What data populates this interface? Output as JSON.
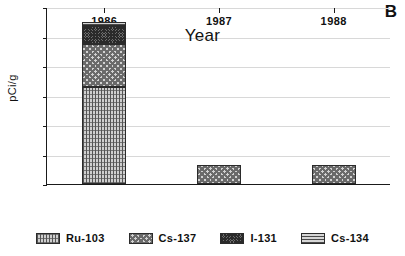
{
  "chart_data": {
    "type": "bar",
    "subtype": "stacked-bar",
    "title": "",
    "panel_label": "B",
    "xlabel": "Year",
    "ylabel": "pCi/g",
    "categories": [
      "1986",
      "1987",
      "1988"
    ],
    "ylim": [
      0,
      1.2
    ],
    "ytick_labels": [
      "0",
      "0.2",
      "0.4",
      "0.6",
      "0.8",
      "1",
      "1.2"
    ],
    "ytick_values": [
      0,
      0.2,
      0.4,
      0.6,
      0.8,
      1.0,
      1.2
    ],
    "grid": "horizontal",
    "legend_position": "bottom",
    "series": [
      {
        "name": "Ru-103",
        "pattern": "vertical-grid",
        "values": [
          0.66,
          0,
          0
        ]
      },
      {
        "name": "Cs-137",
        "pattern": "coarse-checker",
        "values": [
          0.29,
          0.13,
          0.13
        ]
      },
      {
        "name": "I-131",
        "pattern": "dark-checker",
        "values": [
          0.12,
          0,
          0
        ]
      },
      {
        "name": "Cs-134",
        "pattern": "horizontal-lines",
        "values": [
          0.03,
          0,
          0
        ]
      }
    ],
    "totals": [
      1.1,
      0.13,
      0.13
    ]
  },
  "legend": {
    "items": [
      {
        "label": "Ru-103"
      },
      {
        "label": "Cs-137"
      },
      {
        "label": "I-131"
      },
      {
        "label": "Cs-134"
      }
    ]
  },
  "colors": {
    "axis": "#1a1a1a",
    "gridline": "#d8d8d8",
    "background": "#ffffff",
    "ru103": "#cfcfcf",
    "cs137": "#d2d2d2",
    "i131": "#6d6d6d",
    "cs134": "#d6d6d6"
  }
}
